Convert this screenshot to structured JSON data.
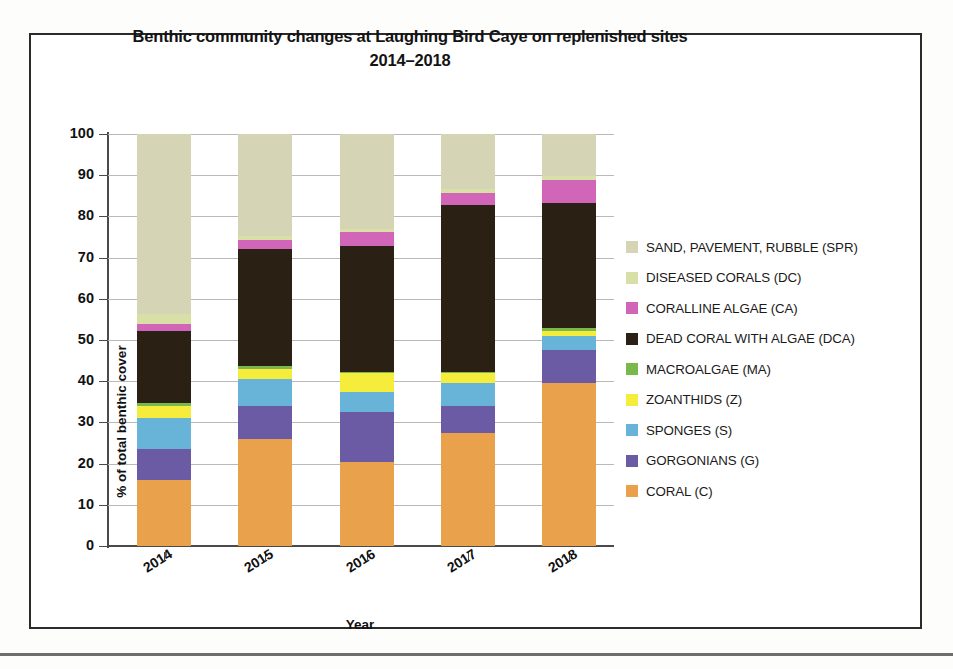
{
  "chart_data": {
    "type": "bar",
    "stacked": true,
    "title": "Benthic community changes at Laughing Bird Caye on replenished sites 2014–2018",
    "title_line1": "Benthic community changes at Laughing Bird Caye on replenished sites",
    "title_line2": "2014–2018",
    "xlabel": "Year",
    "ylabel": "% of total benthic cover",
    "ylim": [
      0,
      100
    ],
    "yticks": [
      0,
      10,
      20,
      30,
      40,
      50,
      60,
      70,
      80,
      90,
      100
    ],
    "grid": true,
    "legend_position": "right",
    "categories": [
      "2014",
      "2015",
      "2016",
      "2017",
      "2018"
    ],
    "series": [
      {
        "name": "CORAL (C)",
        "key": "C",
        "color": "#E9A14B",
        "values": [
          16,
          26,
          20.5,
          27.5,
          39.5
        ]
      },
      {
        "name": "GORGONIANS (G)",
        "key": "G",
        "color": "#6B5BA5",
        "values": [
          7.5,
          8,
          12,
          6.5,
          8
        ]
      },
      {
        "name": "SPONGES (S)",
        "key": "S",
        "color": "#68B4D8",
        "values": [
          7.5,
          6.5,
          5,
          5.5,
          3.5
        ]
      },
      {
        "name": "ZOANTHIDS (Z)",
        "key": "Z",
        "color": "#F5EC3C",
        "values": [
          3,
          2.5,
          4.5,
          2.5,
          1.2
        ]
      },
      {
        "name": "MACROALGAE (MA)",
        "key": "MA",
        "color": "#7BB84B",
        "values": [
          0.6,
          0.6,
          0.3,
          0.3,
          0.6
        ]
      },
      {
        "name": "DEAD CORAL WITH ALGAE (DCA)",
        "key": "DCA",
        "color": "#2A2114",
        "values": [
          17.5,
          28.5,
          30.5,
          40.5,
          30.5
        ]
      },
      {
        "name": "CORALLINE ALGAE (CA)",
        "key": "CA",
        "color": "#D166B8",
        "values": [
          1.8,
          2.2,
          3.5,
          2.8,
          5.5
        ]
      },
      {
        "name": "DISEASED CORALS (DC)",
        "key": "DC",
        "color": "#D8E0A8",
        "values": [
          2.4,
          1.0,
          0.7,
          1.0,
          0.9
        ]
      },
      {
        "name": "SAND, PAVEMENT, RUBBLE (SPR)",
        "key": "SPR",
        "color": "#D5D4B4",
        "values": [
          43.7,
          24.7,
          23.0,
          13.4,
          10.3
        ]
      }
    ],
    "legend_order": [
      "SAND, PAVEMENT, RUBBLE (SPR)",
      "DISEASED CORALS (DC)",
      "CORALLINE ALGAE (CA)",
      "DEAD CORAL WITH ALGAE (DCA)",
      "MACROALGAE (MA)",
      "ZOANTHIDS (Z)",
      "SPONGES (S)",
      "GORGONIANS (G)",
      "CORAL (C)"
    ]
  },
  "legend": {
    "items": [
      {
        "label": "SAND, PAVEMENT, RUBBLE (SPR)",
        "color": "#D5D4B4"
      },
      {
        "label": "DISEASED CORALS (DC)",
        "color": "#D8E0A8"
      },
      {
        "label": "CORALLINE ALGAE (CA)",
        "color": "#D166B8"
      },
      {
        "label": "DEAD CORAL WITH ALGAE (DCA)",
        "color": "#2A2114"
      },
      {
        "label": "MACROALGAE (MA)",
        "color": "#7BB84B"
      },
      {
        "label": "ZOANTHIDS (Z)",
        "color": "#F5EC3C"
      },
      {
        "label": "SPONGES (S)",
        "color": "#68B4D8"
      },
      {
        "label": "GORGONIANS (G)",
        "color": "#6B5BA5"
      },
      {
        "label": "CORAL (C)",
        "color": "#E9A14B"
      }
    ]
  }
}
